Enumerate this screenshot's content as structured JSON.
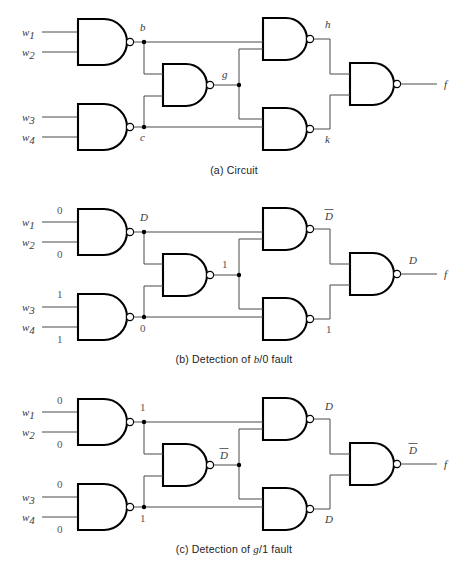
{
  "figure": {
    "panels": [
      {
        "id": "a",
        "caption_prefix": "(a) Circuit",
        "caption_full": "(a) Circuit",
        "inputs": [
          {
            "name": "w1",
            "label": "w",
            "sub": "1",
            "value": ""
          },
          {
            "name": "w2",
            "label": "w",
            "sub": "2",
            "value": ""
          },
          {
            "name": "w3",
            "label": "w",
            "sub": "3",
            "value": ""
          },
          {
            "name": "w4",
            "label": "w",
            "sub": "4",
            "value": ""
          }
        ],
        "nodes": [
          {
            "name": "b",
            "label": "b",
            "bar": false
          },
          {
            "name": "c",
            "label": "c",
            "bar": false
          },
          {
            "name": "g",
            "label": "g",
            "bar": false
          },
          {
            "name": "h",
            "label": "h",
            "bar": false
          },
          {
            "name": "k",
            "label": "k",
            "bar": false
          },
          {
            "name": "f",
            "label": "f",
            "bar": false
          }
        ],
        "output_value": "",
        "output_value_bar": false
      },
      {
        "id": "b",
        "caption_prefix": "(b) Detection of ",
        "caption_var": "b",
        "caption_mid": "/0",
        "caption_suffix": " fault",
        "caption_full": "(b) Detection of b/0 fault",
        "inputs": [
          {
            "name": "w1",
            "label": "w",
            "sub": "1",
            "value": "0"
          },
          {
            "name": "w2",
            "label": "w",
            "sub": "2",
            "value": "0"
          },
          {
            "name": "w3",
            "label": "w",
            "sub": "3",
            "value": "1"
          },
          {
            "name": "w4",
            "label": "w",
            "sub": "4",
            "value": "1"
          }
        ],
        "nodes": [
          {
            "name": "b",
            "label": "D",
            "bar": false
          },
          {
            "name": "c",
            "label": "0",
            "bar": false
          },
          {
            "name": "g",
            "label": "1",
            "bar": false
          },
          {
            "name": "h",
            "label": "D",
            "bar": true
          },
          {
            "name": "k",
            "label": "1",
            "bar": false
          },
          {
            "name": "f",
            "label": "f",
            "bar": false
          }
        ],
        "output_value": "D",
        "output_value_bar": false
      },
      {
        "id": "c",
        "caption_prefix": "(c) Detection of ",
        "caption_var": "g",
        "caption_mid": "/1",
        "caption_suffix": " fault",
        "caption_full": "(c) Detection of g/1 fault",
        "inputs": [
          {
            "name": "w1",
            "label": "w",
            "sub": "1",
            "value": "0"
          },
          {
            "name": "w2",
            "label": "w",
            "sub": "2",
            "value": "0"
          },
          {
            "name": "w3",
            "label": "w",
            "sub": "3",
            "value": "0"
          },
          {
            "name": "w4",
            "label": "w",
            "sub": "4",
            "value": "0"
          }
        ],
        "nodes": [
          {
            "name": "b",
            "label": "1",
            "bar": false
          },
          {
            "name": "c",
            "label": "1",
            "bar": false
          },
          {
            "name": "g",
            "label": "D",
            "bar": true
          },
          {
            "name": "h",
            "label": "D",
            "bar": false
          },
          {
            "name": "k",
            "label": "D",
            "bar": false
          },
          {
            "name": "f",
            "label": "f",
            "bar": false
          }
        ],
        "output_value": "D",
        "output_value_bar": true
      }
    ],
    "gates": [
      {
        "name": "nand-b",
        "type": "NAND",
        "output_node": "b"
      },
      {
        "name": "nand-c",
        "type": "NAND",
        "output_node": "c"
      },
      {
        "name": "nand-g",
        "type": "NAND",
        "output_node": "g"
      },
      {
        "name": "nand-h",
        "type": "NAND",
        "output_node": "h"
      },
      {
        "name": "nand-k",
        "type": "NAND",
        "output_node": "k"
      },
      {
        "name": "nand-f",
        "type": "NAND",
        "output_node": "f"
      }
    ],
    "colors": {
      "wire": "#4a4a4a",
      "gate_outline": "#000000",
      "label_text": "#3a3a3a",
      "value_text": "#55555a",
      "background": "#ffffff"
    }
  }
}
